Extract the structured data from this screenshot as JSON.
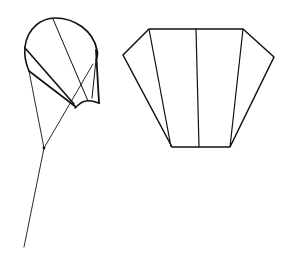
{
  "diagram": {
    "width": 293,
    "height": 253,
    "background": "#ffffff",
    "stroke_color": "#111111",
    "figures": [
      {
        "name": "parafoil-kite-side-view",
        "description": "Rounded canopy kite with bridle lines meeting at a knot and a tow line"
      },
      {
        "name": "sled-kite-flat-plan",
        "description": "Flat hexagonal kite panel with three vertical spars"
      }
    ]
  }
}
